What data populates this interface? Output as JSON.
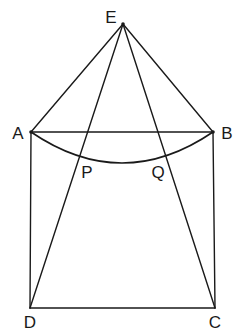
{
  "diagram": {
    "title": "",
    "colors": {
      "stroke": "#1a1a1a",
      "background": "#ffffff"
    },
    "points": {
      "E": {
        "label": "E"
      },
      "A": {
        "label": "A"
      },
      "B": {
        "label": "B"
      },
      "C": {
        "label": "C"
      },
      "D": {
        "label": "D"
      },
      "P": {
        "label": "P"
      },
      "Q": {
        "label": "Q"
      }
    },
    "segments": [
      [
        "E",
        "A"
      ],
      [
        "E",
        "B"
      ],
      [
        "E",
        "D"
      ],
      [
        "E",
        "C"
      ],
      [
        "A",
        "B"
      ],
      [
        "A",
        "D"
      ],
      [
        "B",
        "C"
      ],
      [
        "D",
        "C"
      ]
    ],
    "arcs": [
      {
        "from": "A",
        "to": "B",
        "through": [
          "P",
          "Q"
        ],
        "center": "E"
      }
    ]
  }
}
